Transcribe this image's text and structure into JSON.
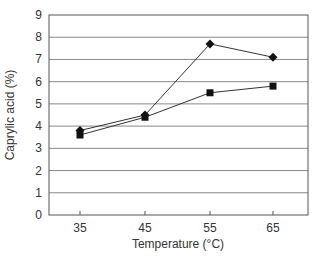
{
  "chart_data": {
    "type": "line",
    "title": "",
    "xlabel": "Temperature (°C)",
    "ylabel": "Caprylic acid (%)",
    "x": [
      35,
      45,
      55,
      65
    ],
    "categories": [
      "35",
      "45",
      "55",
      "65"
    ],
    "ylim": [
      0,
      9
    ],
    "yticks": [
      0,
      1,
      2,
      3,
      4,
      5,
      6,
      7,
      8,
      9
    ],
    "grid": true,
    "legend": null,
    "series": [
      {
        "name": "diamond series",
        "marker": "diamond",
        "values": [
          3.8,
          4.5,
          7.7,
          7.1
        ]
      },
      {
        "name": "square series",
        "marker": "square",
        "values": [
          3.6,
          4.4,
          5.5,
          5.8
        ]
      }
    ]
  },
  "colors": {
    "line": "#333333",
    "marker": "#111111",
    "grid": "#888888",
    "axis": "#555555"
  }
}
